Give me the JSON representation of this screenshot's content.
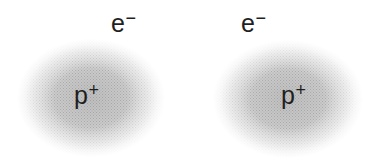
{
  "figure": {
    "atoms": [
      {
        "id": "left",
        "electron_label": {
          "base": "e",
          "sup": "−"
        },
        "proton_label": {
          "base": "p",
          "sup": "+"
        }
      },
      {
        "id": "right",
        "electron_label": {
          "base": "e",
          "sup": "−"
        },
        "proton_label": {
          "base": "p",
          "sup": "+"
        }
      }
    ],
    "colors": {
      "background": "#ffffff",
      "cloud_mid": "#d4d4d4",
      "cloud_center": "#bdbdbd",
      "text": "#1f1f1f"
    }
  }
}
